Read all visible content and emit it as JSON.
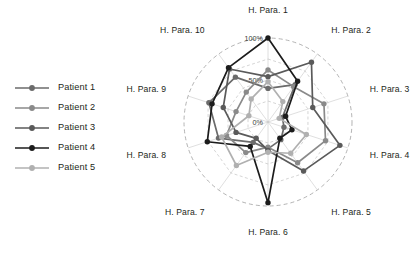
{
  "legend": {
    "items": [
      {
        "label": "Patient 1",
        "color": "#6b6b6b"
      },
      {
        "label": "Patient 2",
        "color": "#8a8a8a"
      },
      {
        "label": "Patient 3",
        "color": "#5a5a5a"
      },
      {
        "label": "Patient 4",
        "color": "#1c1c1c"
      },
      {
        "label": "Patient 5",
        "color": "#b0b0b0"
      }
    ]
  },
  "chart_data": {
    "type": "radar",
    "title": "",
    "categories": [
      "H. Para. 1",
      "H. Para. 2",
      "H. Para. 3",
      "H. Para. 4",
      "H. Para. 5",
      "H. Para. 6",
      "H. Para. 7",
      "H. Para. 8",
      "H. Para. 9",
      "H. Para. 10"
    ],
    "tick_labels": [
      "0%",
      "50%",
      "100%"
    ],
    "tick_values": [
      0,
      50,
      100
    ],
    "rlim": [
      0,
      100
    ],
    "grid": true,
    "outer_ring_style": "dashed",
    "legend_position": "left",
    "unit": "%",
    "series": [
      {
        "name": "Patient 1",
        "color": "#6b6b6b",
        "values": [
          40,
          55,
          18,
          20,
          26,
          32,
          30,
          62,
          74,
          66
        ]
      },
      {
        "name": "Patient 2",
        "color": "#8a8a8a",
        "values": [
          62,
          52,
          70,
          72,
          60,
          30,
          45,
          52,
          40,
          44
        ]
      },
      {
        "name": "Patient 3",
        "color": "#5a5a5a",
        "values": [
          54,
          88,
          56,
          90,
          72,
          34,
          24,
          40,
          56,
          78
        ],
        "note": "reaches near outer ring at H. Para. 2 and H. Para. 4"
      },
      {
        "name": "Patient 4",
        "color": "#1c1c1c",
        "values": [
          100,
          60,
          22,
          30,
          24,
          96,
          36,
          76,
          70,
          80
        ]
      },
      {
        "name": "Patient 5",
        "color": "#b0b0b0",
        "values": [
          48,
          30,
          14,
          48,
          46,
          36,
          64,
          58,
          24,
          34
        ]
      }
    ]
  }
}
